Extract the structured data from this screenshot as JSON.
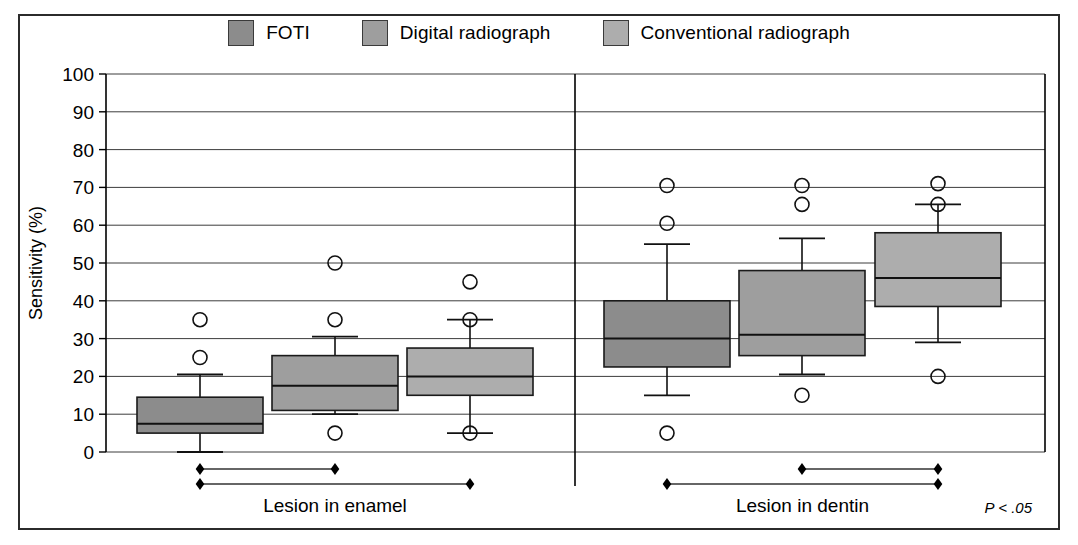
{
  "legend": {
    "items": [
      {
        "label": "FOTI",
        "color": "#8c8c8c",
        "name": "legend-swatch-foti"
      },
      {
        "label": "Digital radiograph",
        "color": "#9e9e9e",
        "name": "legend-swatch-digital"
      },
      {
        "label": "Conventional radiograph",
        "color": "#adadad",
        "name": "legend-swatch-conventional"
      }
    ]
  },
  "axis": {
    "ylabel": "Sensitivity (%)",
    "yticks": [
      "0",
      "10",
      "20",
      "30",
      "40",
      "50",
      "60",
      "70",
      "80",
      "90",
      "100"
    ]
  },
  "groups": [
    {
      "label": "Lesion in enamel"
    },
    {
      "label": "Lesion in dentin"
    }
  ],
  "significance": {
    "note": "P < .05"
  },
  "chart_data": {
    "type": "box",
    "title": "",
    "xlabel": "",
    "ylabel": "Sensitivity (%)",
    "ylim": [
      0,
      100
    ],
    "ytick_step": 10,
    "grid": true,
    "legend_position": "top-center",
    "groups": [
      "Lesion in enamel",
      "Lesion in dentin"
    ],
    "series": [
      "FOTI",
      "Digital radiograph",
      "Conventional radiograph"
    ],
    "boxes": [
      {
        "group": "Lesion in enamel",
        "series": "FOTI",
        "fill": "#8c8c8c",
        "whisker_low": 0,
        "q1": 5,
        "median": 7.5,
        "q3": 14.5,
        "whisker_high": 20.5,
        "outliers": [
          25,
          35
        ]
      },
      {
        "group": "Lesion in enamel",
        "series": "Digital radiograph",
        "fill": "#9e9e9e",
        "whisker_low": 10,
        "q1": 11,
        "median": 17.5,
        "q3": 25.5,
        "whisker_high": 30.5,
        "outliers": [
          5,
          35,
          50
        ]
      },
      {
        "group": "Lesion in enamel",
        "series": "Conventional radiograph",
        "fill": "#adadad",
        "whisker_low": 5,
        "q1": 15,
        "median": 20,
        "q3": 27.5,
        "whisker_high": 35,
        "outliers": [
          5,
          35,
          45
        ]
      },
      {
        "group": "Lesion in dentin",
        "series": "FOTI",
        "fill": "#8c8c8c",
        "whisker_low": 15,
        "q1": 22.5,
        "median": 30,
        "q3": 40,
        "whisker_high": 55,
        "outliers": [
          5,
          60.5,
          70.5
        ]
      },
      {
        "group": "Lesion in dentin",
        "series": "Digital radiograph",
        "fill": "#9e9e9e",
        "whisker_low": 20.5,
        "q1": 25.5,
        "median": 31,
        "q3": 48,
        "whisker_high": 56.5,
        "outliers": [
          15,
          65.5,
          70.5
        ]
      },
      {
        "group": "Lesion in dentin",
        "series": "Conventional radiograph",
        "fill": "#adadad",
        "whisker_low": 29,
        "q1": 38.5,
        "median": 46,
        "q3": 58,
        "whisker_high": 65.5,
        "outliers": [
          20,
          65.5,
          71
        ]
      }
    ],
    "significance_bars": [
      {
        "group": "Lesion in enamel",
        "from": "FOTI",
        "to": "Digital radiograph",
        "row": 0,
        "label": "P < .05"
      },
      {
        "group": "Lesion in enamel",
        "from": "FOTI",
        "to": "Conventional radiograph",
        "row": 1,
        "label": "P < .05"
      },
      {
        "group": "Lesion in dentin",
        "from": "Digital radiograph",
        "to": "Conventional radiograph",
        "row": 0,
        "label": "P < .05"
      },
      {
        "group": "Lesion in dentin",
        "from": "FOTI",
        "to": "Conventional radiograph",
        "row": 1,
        "label": "P < .05"
      }
    ]
  }
}
